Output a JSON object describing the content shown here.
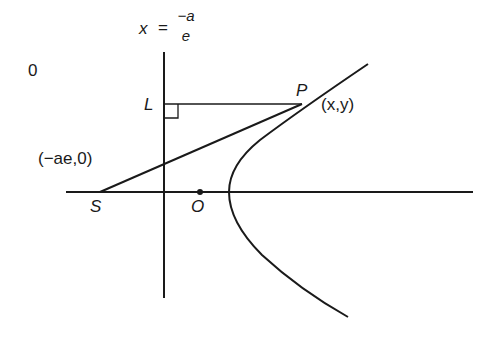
{
  "diagram": {
    "corner_label": "0",
    "directrix_label": {
      "lhs": "x",
      "eq": "=",
      "num": "−a",
      "den": "e"
    },
    "points": {
      "L": "L",
      "P": "P",
      "P_coords": "(x,y)",
      "S": "S",
      "S_coords": "(−ae,0)",
      "O": "O"
    },
    "colors": {
      "stroke": "#1a1a1a",
      "background": "#ffffff"
    }
  }
}
